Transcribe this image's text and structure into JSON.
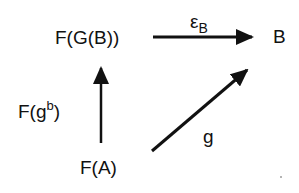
{
  "diagram": {
    "type": "commutative-diagram",
    "nodes": {
      "fgb": {
        "label": "F(G(B))"
      },
      "b": {
        "label": "B"
      },
      "fa": {
        "label": "F(A)"
      }
    },
    "edges": {
      "epsilon": {
        "from": "F(G(B))",
        "to": "B",
        "label_main": "ε",
        "label_sub": "B"
      },
      "fg_flat": {
        "from": "F(A)",
        "to": "F(G(B))",
        "label_prefix": "F(g",
        "label_sup": "b",
        "label_suffix": ")"
      },
      "g": {
        "from": "F(A)",
        "to": "B",
        "label": "g"
      }
    },
    "colors": {
      "ink": "#111111",
      "background": "#ffffff"
    }
  }
}
